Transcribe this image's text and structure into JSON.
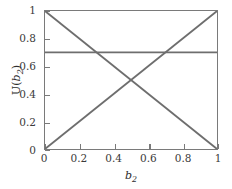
{
  "figure": {
    "background_color": "#ffffff",
    "axis_color": "#7a7a7a",
    "line_color": "#6e6e6e",
    "width": 232,
    "height": 189
  },
  "axes": {
    "xlabel_main": "b",
    "xlabel_sub": "2",
    "ylabel_prefix": "U(",
    "ylabel_main": "b",
    "ylabel_sub": "2",
    "ylabel_suffix": ")",
    "xticks": [
      "0",
      "0.2",
      "0.4",
      "0.6",
      "0.8",
      "1"
    ],
    "yticks": [
      "0",
      "0.2",
      "0.4",
      "0.6",
      "0.8",
      "1"
    ]
  },
  "chart_data": {
    "type": "line",
    "title": "",
    "xlabel": "b_2",
    "ylabel": "U(b_2)",
    "xlim": [
      0,
      1
    ],
    "ylim": [
      0,
      1
    ],
    "grid": false,
    "legend": "none",
    "xticks": [
      0,
      0.2,
      0.4,
      0.6,
      0.8,
      1
    ],
    "yticks": [
      0,
      0.2,
      0.4,
      0.6,
      0.8,
      1
    ],
    "series": [
      {
        "name": "decreasing-utility",
        "color": "#6e6e6e",
        "linewidth": 1.8,
        "x": [
          0,
          1
        ],
        "values": [
          1,
          0
        ]
      },
      {
        "name": "increasing-utility",
        "color": "#6e6e6e",
        "linewidth": 1.8,
        "x": [
          0,
          1
        ],
        "values": [
          0,
          1
        ]
      },
      {
        "name": "constant-utility",
        "color": "#6e6e6e",
        "linewidth": 1.8,
        "x": [
          0,
          1
        ],
        "values": [
          0.7,
          0.7
        ]
      }
    ],
    "annotations": [
      {
        "name": "crossing-point",
        "x": 0.5,
        "y": 0.5
      },
      {
        "name": "constant-meets-decreasing",
        "x": 0.3,
        "y": 0.7
      },
      {
        "name": "constant-meets-increasing",
        "x": 0.7,
        "y": 0.7
      }
    ]
  }
}
